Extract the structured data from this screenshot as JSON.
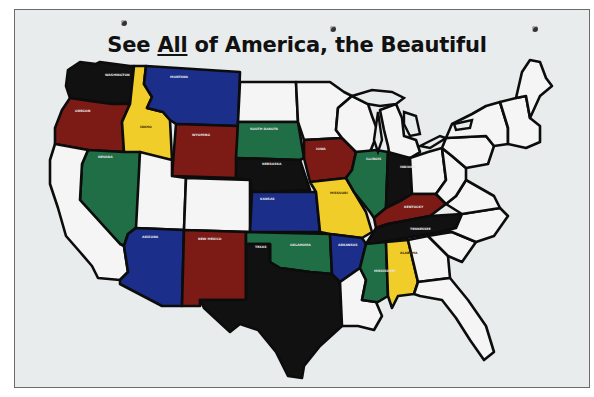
{
  "title": {
    "prefix": "See ",
    "emphasis": "All",
    "suffix": " of America, the Beautiful"
  },
  "colors": {
    "board": "#e9ecec",
    "outline": "#0c0c0c",
    "blue": "#1b2f8a",
    "green": "#1f6e45",
    "red": "#7c1a16",
    "yellow": "#f1cd2a",
    "black": "#111111",
    "white": "#f4f5f4"
  },
  "states": [
    {
      "id": "washington",
      "label": "WASHINGTON",
      "color": "black"
    },
    {
      "id": "oregon",
      "label": "OREGON",
      "color": "red"
    },
    {
      "id": "idaho",
      "label": "IDAHO",
      "color": "yellow"
    },
    {
      "id": "montana",
      "label": "MONTANA",
      "color": "blue"
    },
    {
      "id": "wyoming",
      "label": "WYOMING",
      "color": "red"
    },
    {
      "id": "nevada",
      "label": "NEVADA",
      "color": "green"
    },
    {
      "id": "california",
      "label": "",
      "color": "white"
    },
    {
      "id": "utah",
      "label": "",
      "color": "white"
    },
    {
      "id": "colorado",
      "label": "",
      "color": "white"
    },
    {
      "id": "arizona",
      "label": "ARIZONA",
      "color": "blue"
    },
    {
      "id": "new-mexico",
      "label": "NEW MEXICO",
      "color": "red"
    },
    {
      "id": "north-dakota",
      "label": "",
      "color": "white"
    },
    {
      "id": "south-dakota",
      "label": "SOUTH DAKOTA",
      "color": "green"
    },
    {
      "id": "nebraska",
      "label": "NEBRASKA",
      "color": "black"
    },
    {
      "id": "kansas",
      "label": "KANSAS",
      "color": "blue"
    },
    {
      "id": "oklahoma",
      "label": "OKLAHOMA",
      "color": "green"
    },
    {
      "id": "texas",
      "label": "TEXAS",
      "color": "black"
    },
    {
      "id": "minnesota",
      "label": "",
      "color": "white"
    },
    {
      "id": "iowa",
      "label": "IOWA",
      "color": "red"
    },
    {
      "id": "missouri",
      "label": "MISSOURI",
      "color": "yellow"
    },
    {
      "id": "arkansas",
      "label": "ARKANSAS",
      "color": "blue"
    },
    {
      "id": "louisiana",
      "label": "",
      "color": "white"
    },
    {
      "id": "wisconsin",
      "label": "",
      "color": "white"
    },
    {
      "id": "illinois",
      "label": "ILLINOIS",
      "color": "green"
    },
    {
      "id": "michigan",
      "label": "",
      "color": "white"
    },
    {
      "id": "indiana",
      "label": "INDIANA",
      "color": "black"
    },
    {
      "id": "ohio",
      "label": "",
      "color": "white"
    },
    {
      "id": "kentucky",
      "label": "KENTUCKY",
      "color": "red"
    },
    {
      "id": "tennessee",
      "label": "TENNESSEE",
      "color": "black"
    },
    {
      "id": "mississippi",
      "label": "MISSISSIPPI",
      "color": "green"
    },
    {
      "id": "alabama",
      "label": "ALABAMA",
      "color": "yellow"
    },
    {
      "id": "georgia",
      "label": "",
      "color": "white"
    },
    {
      "id": "florida",
      "label": "",
      "color": "white"
    },
    {
      "id": "south-carolina",
      "label": "",
      "color": "white"
    },
    {
      "id": "north-carolina",
      "label": "",
      "color": "white"
    },
    {
      "id": "virginia",
      "label": "",
      "color": "white"
    },
    {
      "id": "west-virginia",
      "label": "",
      "color": "white"
    },
    {
      "id": "pennsylvania",
      "label": "",
      "color": "white"
    },
    {
      "id": "new-york",
      "label": "",
      "color": "white"
    },
    {
      "id": "new-england",
      "label": "",
      "color": "white"
    },
    {
      "id": "maine",
      "label": "",
      "color": "white"
    }
  ]
}
